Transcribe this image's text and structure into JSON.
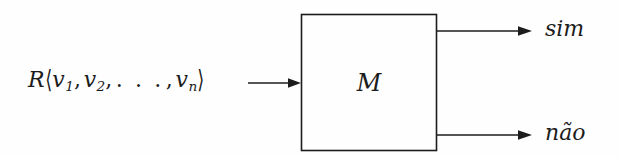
{
  "diagram": {
    "type": "block-diagram",
    "title": "",
    "background_color": "#fefefe",
    "stroke_color": "#1c1c1c",
    "input": {
      "relation": "R",
      "open_bracket": "⟨",
      "close_bracket": "⟩",
      "variable": "v",
      "subscripts": [
        "1",
        "2",
        "n"
      ],
      "ellipsis": ". . .",
      "comma": ",",
      "full_text": "R⟨v1, v2, . . . , vn⟩",
      "arrow_name": "input-arrow"
    },
    "machine": {
      "label": "M",
      "shape": "rectangle",
      "x": 301,
      "y": 14,
      "width": 136,
      "height": 137
    },
    "outputs": [
      {
        "label": "sim",
        "arrow_name": "output-arrow-sim",
        "y": 31
      },
      {
        "label": "não",
        "arrow_name": "output-arrow-nao",
        "y": 135
      }
    ]
  }
}
